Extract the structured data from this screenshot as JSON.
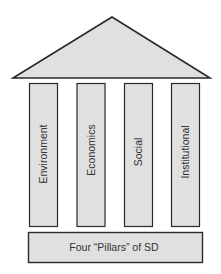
{
  "diagram": {
    "title": "Four “Pillars” of SD",
    "pillars": [
      {
        "label": "Environment"
      },
      {
        "label": "Economics"
      },
      {
        "label": "Social"
      },
      {
        "label": "Institutional"
      }
    ],
    "colors": {
      "fill": "#e0e0e0",
      "stroke": "#2a2a2a",
      "text": "#333333"
    }
  }
}
